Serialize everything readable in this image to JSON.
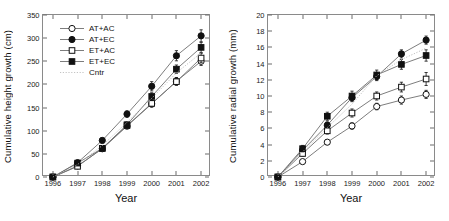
{
  "figure": {
    "panels": 2
  },
  "chart_data": [
    {
      "type": "line",
      "panel": "left",
      "title": "",
      "xlabel": "Year",
      "ylabel": "Cumulative height growth (cm)",
      "x": [
        1996,
        1997,
        1998,
        1999,
        2000,
        2001,
        2002
      ],
      "categories": [
        "1996",
        "1997",
        "1998",
        "1999",
        "2000",
        "2001",
        "2002"
      ],
      "xlim": [
        1995.6,
        2002.4
      ],
      "ylim": [
        0,
        350
      ],
      "yticks": [
        0,
        50,
        100,
        150,
        200,
        250,
        300,
        350
      ],
      "grid": false,
      "legend_position": "upper-left",
      "series": [
        {
          "name": "AT+AC",
          "marker": "open-circle",
          "values": [
            0,
            24,
            61,
            110,
            158,
            207,
            250
          ],
          "errors": [
            0,
            3,
            4,
            6,
            7,
            8,
            9
          ]
        },
        {
          "name": "AT+EC",
          "marker": "filled-circle",
          "values": [
            0,
            31,
            79,
            136,
            196,
            262,
            305
          ],
          "errors": [
            0,
            3,
            5,
            7,
            10,
            11,
            13
          ]
        },
        {
          "name": "ET+AC",
          "marker": "open-square",
          "values": [
            0,
            23,
            62,
            111,
            159,
            206,
            257
          ],
          "errors": [
            0,
            3,
            4,
            6,
            7,
            8,
            10
          ]
        },
        {
          "name": "ET+EC",
          "marker": "filled-square",
          "values": [
            0,
            30,
            62,
            113,
            174,
            233,
            280
          ],
          "errors": [
            0,
            3,
            5,
            6,
            8,
            9,
            11
          ]
        },
        {
          "name": "Cntr",
          "marker": "dotted-line",
          "values": [
            0,
            27,
            68,
            118,
            170,
            225,
            268
          ],
          "errors": [
            0,
            0,
            0,
            0,
            0,
            0,
            0
          ]
        }
      ]
    },
    {
      "type": "line",
      "panel": "right",
      "title": "",
      "xlabel": "Year",
      "ylabel": "Cumulative radial growth (mm)",
      "x": [
        1996,
        1997,
        1998,
        1999,
        2000,
        2001,
        2002
      ],
      "categories": [
        "1996",
        "1997",
        "1998",
        "1999",
        "2000",
        "2001",
        "2002"
      ],
      "xlim": [
        1995.6,
        2002.4
      ],
      "ylim": [
        0,
        20
      ],
      "yticks": [
        0,
        2,
        4,
        6,
        8,
        10,
        12,
        14,
        16,
        18,
        20
      ],
      "grid": false,
      "legend_position": "none",
      "series": [
        {
          "name": "AT+AC",
          "marker": "open-circle",
          "values": [
            0,
            1.9,
            4.3,
            6.3,
            8.7,
            9.5,
            10.2
          ],
          "errors": [
            0,
            0.2,
            0.3,
            0.4,
            0.4,
            0.5,
            0.5
          ]
        },
        {
          "name": "AT+EC",
          "marker": "filled-circle",
          "values": [
            0,
            3.3,
            6.4,
            9.8,
            12.4,
            15.2,
            16.9
          ],
          "errors": [
            0,
            0.3,
            0.4,
            0.5,
            0.5,
            0.5,
            0.5
          ]
        },
        {
          "name": "ET+AC",
          "marker": "open-square",
          "values": [
            0,
            2.9,
            5.7,
            7.9,
            10.0,
            11.1,
            12.1
          ],
          "errors": [
            0,
            0.3,
            0.4,
            0.5,
            0.5,
            0.6,
            0.8
          ]
        },
        {
          "name": "ET+EC",
          "marker": "filled-square",
          "values": [
            0,
            3.5,
            7.5,
            10.0,
            12.6,
            13.9,
            15.0
          ],
          "errors": [
            0,
            0.4,
            0.5,
            0.6,
            0.6,
            0.6,
            0.7
          ]
        },
        {
          "name": "Cntr",
          "marker": "dotted-line",
          "values": [
            0,
            3.1,
            6.1,
            9.0,
            12.5,
            14.5,
            15.9
          ],
          "errors": [
            0,
            0,
            0,
            0,
            0,
            0,
            0
          ]
        }
      ]
    }
  ],
  "legend": {
    "entries": [
      {
        "label": "AT+AC",
        "marker": "open-circle"
      },
      {
        "label": "AT+EC",
        "marker": "filled-circle"
      },
      {
        "label": "ET+AC",
        "marker": "open-square"
      },
      {
        "label": "ET+EC",
        "marker": "filled-square"
      },
      {
        "label": "Cntr",
        "marker": "dotted-line"
      }
    ]
  },
  "colors": {
    "line": "#6e6e6e",
    "marker_stroke": "#111111",
    "marker_fill": "#111111",
    "marker_open_fill": "#ffffff",
    "axis": "#8a8a8a",
    "text": "#1a1a1a"
  }
}
